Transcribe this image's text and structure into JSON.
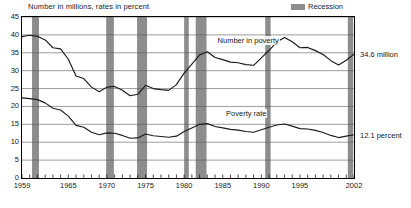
{
  "header": {
    "axis_title": "Number in millions, rates in percent",
    "legend_label": "Recession",
    "legend_color": "#8d8d8d"
  },
  "labels": {
    "series_number": "Number in poverty",
    "series_rate": "Poverty rate",
    "end_number": "34.6 million",
    "end_rate": "12.1 percent",
    "footnote": ""
  },
  "chart_data": {
    "type": "line",
    "title": "Number in millions, rates in percent",
    "xlabel": "",
    "ylabel": "Number in millions, rates in percent",
    "xlim": [
      1959,
      2002
    ],
    "ylim": [
      0,
      45
    ],
    "ytick_step": 5,
    "grid": true,
    "legend_position": "top-right",
    "yticks": [
      0,
      5,
      10,
      15,
      20,
      25,
      30,
      35,
      40,
      45
    ],
    "xticks": [
      1959,
      1965,
      1970,
      1975,
      1980,
      1985,
      1990,
      1995,
      2002
    ],
    "x": [
      1959,
      1960,
      1961,
      1962,
      1963,
      1964,
      1965,
      1966,
      1967,
      1968,
      1969,
      1970,
      1971,
      1972,
      1973,
      1974,
      1975,
      1976,
      1977,
      1978,
      1979,
      1980,
      1981,
      1982,
      1983,
      1984,
      1985,
      1986,
      1987,
      1988,
      1989,
      1990,
      1991,
      1992,
      1993,
      1994,
      1995,
      1996,
      1997,
      1998,
      1999,
      2000,
      2001,
      2002
    ],
    "series": [
      {
        "name": "Number in poverty",
        "unit": "millions",
        "color": "#1a1a1a",
        "values": [
          39.5,
          39.9,
          39.6,
          38.6,
          36.4,
          36.1,
          33.2,
          28.5,
          27.8,
          25.4,
          24.1,
          25.4,
          25.6,
          24.5,
          23.0,
          23.4,
          25.9,
          25.0,
          24.7,
          24.5,
          26.1,
          29.3,
          31.8,
          34.4,
          35.3,
          33.7,
          33.1,
          32.4,
          32.2,
          31.7,
          31.5,
          33.6,
          35.7,
          38.0,
          39.3,
          38.1,
          36.4,
          36.5,
          35.6,
          34.5,
          32.8,
          31.6,
          32.9,
          34.6
        ]
      },
      {
        "name": "Poverty rate",
        "unit": "percent",
        "color": "#1a1a1a",
        "values": [
          22.4,
          22.2,
          21.9,
          21.0,
          19.5,
          19.0,
          17.3,
          14.7,
          14.2,
          12.8,
          12.1,
          12.6,
          12.5,
          11.9,
          11.1,
          11.2,
          12.3,
          11.8,
          11.6,
          11.4,
          11.7,
          13.0,
          14.0,
          15.0,
          15.2,
          14.4,
          14.0,
          13.6,
          13.4,
          13.0,
          12.8,
          13.5,
          14.2,
          14.8,
          15.1,
          14.5,
          13.8,
          13.7,
          13.3,
          12.7,
          11.9,
          11.3,
          11.7,
          12.1
        ]
      }
    ],
    "recession_bands": [
      {
        "start": 1960.3,
        "end": 1961.2
      },
      {
        "start": 1969.9,
        "end": 1970.9
      },
      {
        "start": 1973.9,
        "end": 1975.2
      },
      {
        "start": 1980.0,
        "end": 1980.6
      },
      {
        "start": 1981.5,
        "end": 1982.9
      },
      {
        "start": 1990.5,
        "end": 1991.2
      },
      {
        "start": 2001.2,
        "end": 2001.9
      }
    ],
    "annotations": [
      {
        "text": "34.6 million",
        "series": "Number in poverty",
        "x": 2002,
        "y": 34.6
      },
      {
        "text": "12.1 percent",
        "series": "Poverty rate",
        "x": 2002,
        "y": 12.1
      }
    ]
  }
}
